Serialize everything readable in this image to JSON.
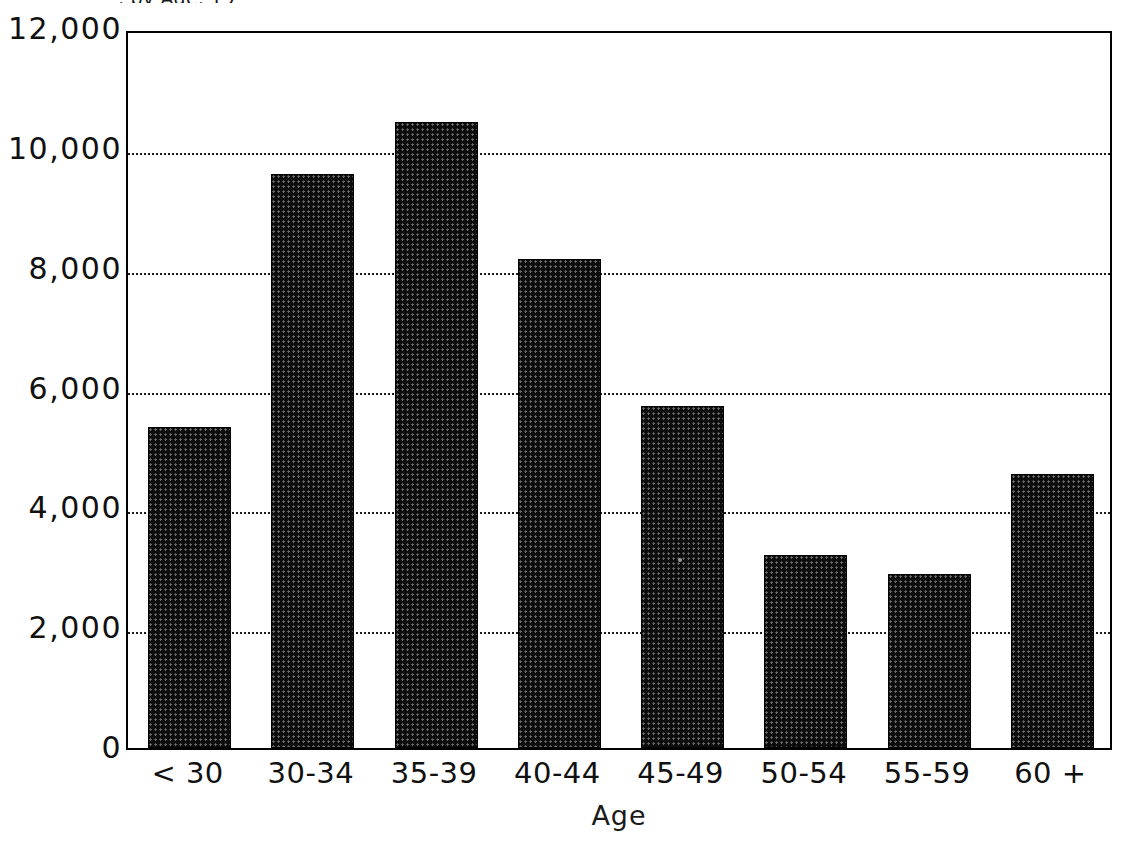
{
  "chart_data": {
    "type": "bar",
    "title": "",
    "xlabel": "Age",
    "ylabel": "",
    "categories": [
      "< 30",
      "30-34",
      "35-39",
      "40-44",
      "45-49",
      "50-54",
      "55-59",
      "60 +"
    ],
    "values": [
      5350,
      9580,
      10450,
      8160,
      5710,
      3220,
      2900,
      4570
    ],
    "ylim": [
      0,
      12000
    ],
    "yticks": [
      0,
      2000,
      4000,
      6000,
      8000,
      10000,
      12000
    ],
    "ytick_labels": [
      "0",
      "2,000",
      "4,000",
      "6,000",
      "8,000",
      "10,000",
      "12,000"
    ],
    "grid": true,
    "grid_style": "dotted",
    "grid_axis": "y",
    "legend": "none",
    "bar_color": "#0d0d0d",
    "bar_fill_pattern": "dense-stipple-halftone",
    "background_color": "#ffffff",
    "axis_color": "#000000"
  },
  "axis": {
    "y_labels": [
      "12,000",
      "10,000",
      "8,000",
      "6,000",
      "4,000",
      "2,000",
      "0"
    ],
    "x_labels": [
      "< 30",
      "30-34",
      "35-39",
      "40-44",
      "45-49",
      "50-54",
      "55-59",
      "60 +"
    ],
    "x_title": "Age"
  },
  "title": {
    "text": ", by Age, 19",
    "note": "top line cropped by image edge"
  }
}
